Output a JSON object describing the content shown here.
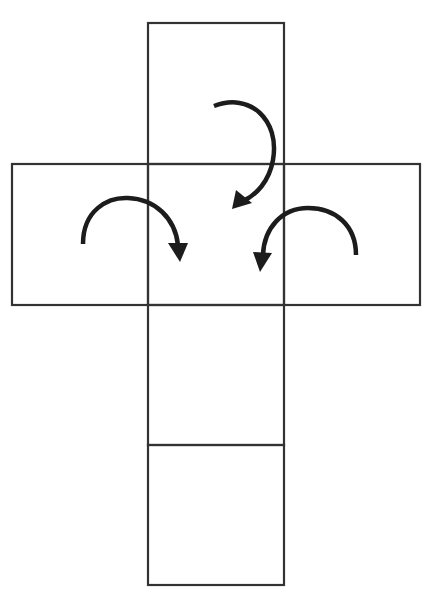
{
  "diagram": {
    "type": "cube-net",
    "colors": {
      "background": "#ffffff",
      "lines": "#333333",
      "arrows": "#1c1c1c"
    },
    "faces": [
      {
        "id": "top",
        "x": 148,
        "y": 23,
        "w": 136,
        "h": 141
      },
      {
        "id": "left",
        "x": 12,
        "y": 164,
        "w": 136,
        "h": 141
      },
      {
        "id": "center",
        "x": 148,
        "y": 164,
        "w": 136,
        "h": 141
      },
      {
        "id": "right",
        "x": 284,
        "y": 164,
        "w": 136,
        "h": 141
      },
      {
        "id": "lower",
        "x": 148,
        "y": 305,
        "w": 136,
        "h": 140
      },
      {
        "id": "bottom",
        "x": 148,
        "y": 445,
        "w": 136,
        "h": 140
      }
    ],
    "arrows": [
      {
        "id": "top-arrow",
        "direction": "clockwise",
        "from_face": "top",
        "to_face": "center"
      },
      {
        "id": "left-arrow",
        "direction": "clockwise",
        "from_face": "left",
        "to_face": "center"
      },
      {
        "id": "right-arrow",
        "direction": "counterclockwise",
        "from_face": "right",
        "to_face": "center"
      }
    ]
  }
}
